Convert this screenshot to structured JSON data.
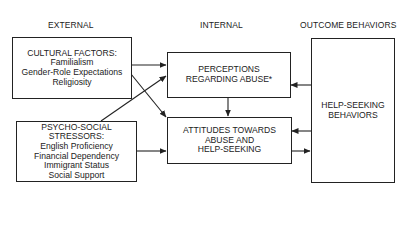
{
  "headers": {
    "external": "EXTERNAL",
    "internal": "INTERNAL",
    "outcome": "OUTCOME BEHAVIORS"
  },
  "boxes": {
    "cultural": {
      "title": "CULTURAL FACTORS:",
      "items": [
        "Familialism",
        "Gender-Role Expectations",
        "Religiosity"
      ]
    },
    "psychosocial": {
      "title_line1": "PSYCHO-SOCIAL",
      "title_line2": "STRESSORS:",
      "items": [
        "English Proficiency",
        "Financial Dependency",
        "Immigrant Status",
        "Social Support"
      ]
    },
    "perceptions": {
      "line1": "PERCEPTIONS",
      "line2": "REGARDING ABUSE*"
    },
    "attitudes": {
      "line1": "ATTITUDES TOWARDS",
      "line2": "ABUSE AND",
      "line3": "HELP-SEEKING"
    },
    "helpseeking": {
      "line1": "HELP-SEEKING",
      "line2": "BEHAVIORS"
    }
  },
  "edges": [
    {
      "from": "cultural",
      "to": "perceptions"
    },
    {
      "from": "cultural",
      "to": "attitudes"
    },
    {
      "from": "psychosocial",
      "to": "perceptions"
    },
    {
      "from": "psychosocial",
      "to": "attitudes"
    },
    {
      "from": "perceptions",
      "to": "attitudes"
    },
    {
      "from": "helpseeking",
      "to": "perceptions"
    },
    {
      "from": "helpseeking",
      "to": "attitudes"
    },
    {
      "from": "attitudes",
      "to": "helpseeking"
    }
  ],
  "colors": {
    "line": "#222222",
    "background": "#ffffff"
  }
}
